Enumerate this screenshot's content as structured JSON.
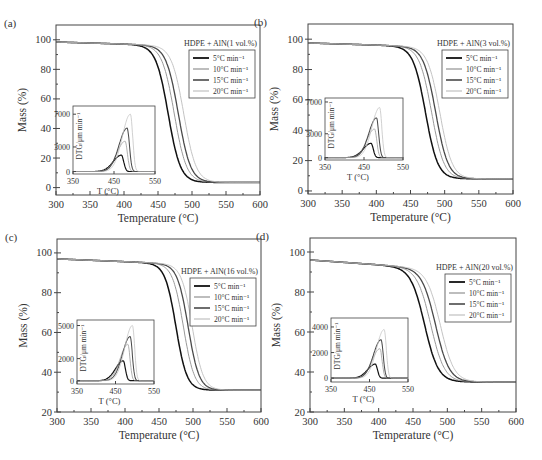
{
  "figure": {
    "width": 542,
    "height": 460
  },
  "style": {
    "series_colors": [
      "#111111",
      "#9a9a9a",
      "#4a4a4a",
      "#c4c4c4"
    ],
    "series_widths": [
      1.5,
      1.0,
      1.3,
      1.0
    ],
    "axis_color": "#444444"
  },
  "chart_data": [
    {
      "type": "line",
      "panel_label": "(a)",
      "legend_title": "HDPE + AlN(1 vol.%)",
      "xlabel": "Temperature (°C)",
      "ylabel": "Mass (%)",
      "xlim": [
        300,
        600
      ],
      "ylim": [
        -5,
        110
      ],
      "xticks": [
        300,
        350,
        400,
        450,
        500,
        550,
        600
      ],
      "yticks": [
        0,
        20,
        40,
        60,
        80,
        100
      ],
      "residue": 3.5,
      "start_mass": 98.5,
      "series": [
        {
          "name": "5°C min⁻¹",
          "t_mid": 465,
          "width": 9
        },
        {
          "name": "10°C min⁻¹",
          "t_mid": 474,
          "width": 9
        },
        {
          "name": "15°C min⁻¹",
          "t_mid": 480,
          "width": 9
        },
        {
          "name": "20°C min⁻¹",
          "t_mid": 488,
          "width": 9
        }
      ],
      "inset": {
        "xlabel": "T (°C)",
        "ylabel": "DTG/μm min⁻¹",
        "xlim": [
          350,
          550
        ],
        "ylim": [
          -300,
          8000
        ],
        "xticks": [
          350,
          450,
          550
        ],
        "yticks": [
          0,
          3000,
          7000
        ],
        "peaks": [
          {
            "name": "5°C min⁻¹",
            "peak_t": 468,
            "peak_v": 2000
          },
          {
            "name": "10°C min⁻¹",
            "peak_t": 477,
            "peak_v": 3700
          },
          {
            "name": "15°C min⁻¹",
            "peak_t": 482,
            "peak_v": 5300
          },
          {
            "name": "20°C min⁻¹",
            "peak_t": 490,
            "peak_v": 7000
          }
        ]
      },
      "box": {
        "x": 56,
        "y": 25,
        "w": 204,
        "h": 170
      },
      "inset_box": {
        "x": 73,
        "y": 106,
        "w": 82,
        "h": 68
      },
      "legend_pos": {
        "x": 186,
        "y": 50
      }
    },
    {
      "type": "line",
      "panel_label": "(b)",
      "legend_title": "HDPE + AlN(3 vol.%)",
      "xlabel": "Temperature (°C)",
      "ylabel": "Mass (%)",
      "xlim": [
        300,
        600
      ],
      "ylim": [
        -2,
        110
      ],
      "xticks": [
        300,
        350,
        400,
        450,
        500,
        550,
        600
      ],
      "yticks": [
        0,
        20,
        40,
        60,
        80,
        100
      ],
      "residue": 8,
      "start_mass": 97.5,
      "series": [
        {
          "name": "5°C min⁻¹",
          "t_mid": 472,
          "width": 9
        },
        {
          "name": "10°C min⁻¹",
          "t_mid": 481,
          "width": 9
        },
        {
          "name": "15°C min⁻¹",
          "t_mid": 487,
          "width": 9
        },
        {
          "name": "20°C min⁻¹",
          "t_mid": 493,
          "width": 9
        }
      ],
      "inset": {
        "xlabel": "T (°C)",
        "ylabel": "DTG/μm min⁻¹",
        "xlim": [
          350,
          550
        ],
        "ylim": [
          -300,
          7500
        ],
        "xticks": [
          350,
          450,
          550
        ],
        "yticks": [
          0,
          3000,
          7000
        ],
        "peaks": [
          {
            "name": "5°C min⁻¹",
            "peak_t": 468,
            "peak_v": 1800
          },
          {
            "name": "10°C min⁻¹",
            "peak_t": 477,
            "peak_v": 3600
          },
          {
            "name": "15°C min⁻¹",
            "peak_t": 482,
            "peak_v": 5000
          },
          {
            "name": "20°C min⁻¹",
            "peak_t": 490,
            "peak_v": 6300
          }
        ]
      },
      "box": {
        "x": 308,
        "y": 24,
        "w": 205,
        "h": 170
      },
      "inset_box": {
        "x": 325,
        "y": 98,
        "w": 78,
        "h": 62
      },
      "legend_pos": {
        "x": 437,
        "y": 50
      }
    },
    {
      "type": "line",
      "panel_label": "(c)",
      "legend_title": "HDPE + AlN(16 vol.%)",
      "xlabel": "Temperature (°C)",
      "ylabel": "Mass (%)",
      "xlim": [
        300,
        600
      ],
      "ylim": [
        20,
        107
      ],
      "xticks": [
        300,
        350,
        400,
        450,
        500,
        550,
        600
      ],
      "yticks": [
        20,
        40,
        60,
        80,
        100
      ],
      "residue": 31,
      "start_mass": 97,
      "series": [
        {
          "name": "5°C min⁻¹",
          "t_mid": 475,
          "width": 8
        },
        {
          "name": "10°C min⁻¹",
          "t_mid": 486,
          "width": 8
        },
        {
          "name": "15°C min⁻¹",
          "t_mid": 493,
          "width": 8
        },
        {
          "name": "20°C min⁻¹",
          "t_mid": 499,
          "width": 8
        }
      ],
      "inset": {
        "xlabel": "T (°C)",
        "ylabel": "DTG/μm min⁻¹",
        "xlim": [
          350,
          550
        ],
        "ylim": [
          -300,
          5500
        ],
        "xticks": [
          350,
          450,
          550
        ],
        "yticks": [
          0,
          2000,
          5000
        ],
        "peaks": [
          {
            "name": "5°C min⁻¹",
            "peak_t": 470,
            "peak_v": 1800
          },
          {
            "name": "10°C min⁻¹",
            "peak_t": 482,
            "peak_v": 3300
          },
          {
            "name": "15°C min⁻¹",
            "peak_t": 488,
            "peak_v": 4000
          },
          {
            "name": "20°C min⁻¹",
            "peak_t": 494,
            "peak_v": 5000
          }
        ]
      },
      "box": {
        "x": 57,
        "y": 239,
        "w": 204,
        "h": 173
      },
      "inset_box": {
        "x": 77,
        "y": 320,
        "w": 77,
        "h": 64
      },
      "legend_pos": {
        "x": 190,
        "y": 278
      }
    },
    {
      "type": "line",
      "panel_label": "(d)",
      "legend_title": "HDPE + AlN(20 vol.%)",
      "xlabel": "Temperature (°C)",
      "ylabel": "Mass (%)",
      "xlim": [
        300,
        600
      ],
      "ylim": [
        20,
        107
      ],
      "xticks": [
        300,
        350,
        400,
        450,
        500,
        550,
        600
      ],
      "yticks": [
        20,
        40,
        60,
        80,
        100
      ],
      "residue": 35,
      "start_mass": 96,
      "series": [
        {
          "name": "5°C min⁻¹",
          "t_mid": 467,
          "width": 10
        },
        {
          "name": "10°C min⁻¹",
          "t_mid": 476,
          "width": 10
        },
        {
          "name": "15°C min⁻¹",
          "t_mid": 483,
          "width": 10
        },
        {
          "name": "20°C min⁻¹",
          "t_mid": 490,
          "width": 10
        }
      ],
      "inset": {
        "xlabel": "T (°C)",
        "ylabel": "DTG/μm min⁻¹",
        "xlim": [
          350,
          550
        ],
        "ylim": [
          -300,
          4700
        ],
        "xticks": [
          350,
          450,
          550
        ],
        "yticks": [
          0,
          2000,
          4000
        ],
        "peaks": [
          {
            "name": "5°C min⁻¹",
            "peak_t": 465,
            "peak_v": 1100
          },
          {
            "name": "10°C min⁻¹",
            "peak_t": 477,
            "peak_v": 2300
          },
          {
            "name": "15°C min⁻¹",
            "peak_t": 480,
            "peak_v": 3000
          },
          {
            "name": "20°C min⁻¹",
            "peak_t": 488,
            "peak_v": 3800
          }
        ]
      },
      "box": {
        "x": 310,
        "y": 238,
        "w": 206,
        "h": 174
      },
      "inset_box": {
        "x": 331,
        "y": 318,
        "w": 77,
        "h": 64
      },
      "legend_pos": {
        "x": 442,
        "y": 274
      }
    }
  ]
}
